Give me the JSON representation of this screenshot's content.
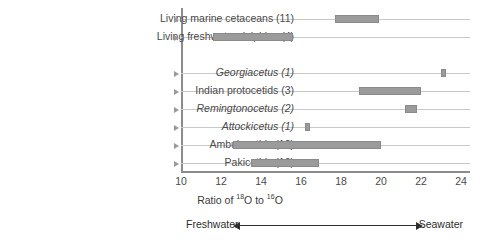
{
  "chart_data": {
    "type": "bar",
    "title": "",
    "xlabel": "Ratio of 18O to 16O",
    "xlabel_parts": {
      "prefix": "Ratio of ",
      "sup1": "18",
      "mid": "O to ",
      "sup2": "16",
      "suffix": "O"
    },
    "ylabel": "",
    "xlim": [
      10,
      24
    ],
    "xticks": [
      10,
      12,
      14,
      16,
      18,
      20,
      22,
      24
    ],
    "xtick_labels": [
      "10",
      "12",
      "14",
      "16",
      "18",
      "20",
      "22",
      "24"
    ],
    "grid": true,
    "legend": false,
    "orientation": "horizontal",
    "categories": [
      "Living marine cetaceans (11)",
      "Living freshwater dolphins (4)",
      "Georgiacetus (1)",
      "Indian protocetids (3)",
      "Remingtonocetus (2)",
      "Attockicetus (1)",
      "Ambulocetids (12)",
      "Pakicetids (10)"
    ],
    "ranges": [
      {
        "label": "Living marine cetaceans (11)",
        "count": 11,
        "low": 17.7,
        "high": 19.9,
        "italic": false,
        "group_gap_after": false
      },
      {
        "label": "Living freshwater dolphins (4)",
        "count": 4,
        "low": 11.6,
        "high": 15.6,
        "italic": false,
        "group_gap_after": true
      },
      {
        "label": "Georgiacetus (1)",
        "count": 1,
        "low": 23.0,
        "high": 23.2,
        "italic": true,
        "group_gap_after": false
      },
      {
        "label": "Indian protocetids (3)",
        "count": 3,
        "low": 18.9,
        "high": 22.0,
        "italic": false,
        "group_gap_after": false
      },
      {
        "label": "Remingtonocetus (2)",
        "count": 2,
        "low": 21.2,
        "high": 21.8,
        "italic": true,
        "group_gap_after": false
      },
      {
        "label": "Attockicetus (1)",
        "count": 1,
        "low": 16.2,
        "high": 16.4,
        "italic": true,
        "group_gap_after": false
      },
      {
        "label": "Ambulocetids (12)",
        "count": 12,
        "low": 12.6,
        "high": 20.0,
        "italic": false,
        "group_gap_after": false
      },
      {
        "label": "Pakicetids (10)",
        "count": 10,
        "low": 13.5,
        "high": 16.9,
        "italic": false,
        "group_gap_after": false
      }
    ],
    "annotations": {
      "left": "Freshwater",
      "right": "Seawater",
      "arrow": "double-headed"
    },
    "colors": {
      "bar": "#9b9b9b",
      "grid": "#c9c9c9",
      "axis": "#8c8c8c",
      "text": "#3b3b3b",
      "background": "#ffffff"
    }
  }
}
